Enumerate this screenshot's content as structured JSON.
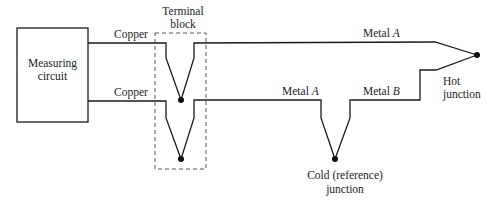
{
  "diagram": {
    "type": "thermocouple-circuit",
    "measuring_circuit": {
      "line1": "Measuring",
      "line2": "circuit"
    },
    "terminal_block": {
      "line1": "Terminal",
      "line2": "block"
    },
    "wires": {
      "copper_top": "Copper",
      "copper_bottom": "Copper",
      "metal_top_prefix": "Metal ",
      "metal_top_letter": "A",
      "metal_lower_a_prefix": "Metal ",
      "metal_lower_a_letter": "A",
      "metal_lower_b_prefix": "Metal ",
      "metal_lower_b_letter": "B"
    },
    "hot_junction": {
      "line1": "Hot",
      "line2": "junction"
    },
    "cold_junction": {
      "line1": "Cold (reference)",
      "line2": "junction"
    },
    "colors": {
      "line": "#1a1a1a",
      "dashed_box": "#555555",
      "background": "#ffffff"
    }
  }
}
